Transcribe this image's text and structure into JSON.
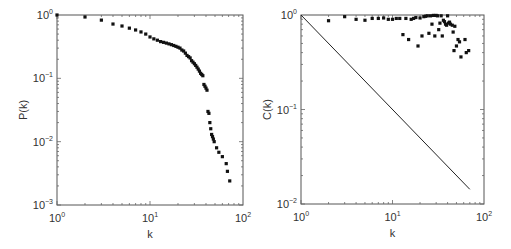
{
  "chart_data": [
    {
      "type": "scatter",
      "title": "",
      "xlabel": "k",
      "ylabel": "P(k)",
      "xscale": "log",
      "yscale": "log",
      "xlim": [
        1,
        100
      ],
      "ylim": [
        0.001,
        1
      ],
      "x_ticks": [
        "10^0",
        "10^1",
        "10^2"
      ],
      "y_ticks": [
        "10^-3",
        "10^-2",
        "10^-1",
        "10^0"
      ],
      "grid": false,
      "legend": null,
      "series": [
        {
          "name": "P(k)",
          "points": [
            [
              1,
              1.0
            ],
            [
              2,
              0.93
            ],
            [
              3,
              0.83
            ],
            [
              4,
              0.72
            ],
            [
              5,
              0.67
            ],
            [
              6,
              0.62
            ],
            [
              7,
              0.58
            ],
            [
              8,
              0.54
            ],
            [
              9,
              0.5
            ],
            [
              10,
              0.45
            ],
            [
              11,
              0.42
            ],
            [
              12,
              0.4
            ],
            [
              13,
              0.38
            ],
            [
              14,
              0.37
            ],
            [
              15,
              0.36
            ],
            [
              16,
              0.35
            ],
            [
              17,
              0.34
            ],
            [
              18,
              0.33
            ],
            [
              19,
              0.32
            ],
            [
              20,
              0.31
            ],
            [
              21,
              0.3
            ],
            [
              22,
              0.28
            ],
            [
              23,
              0.27
            ],
            [
              24,
              0.25
            ],
            [
              25,
              0.23
            ],
            [
              26,
              0.22
            ],
            [
              27,
              0.21
            ],
            [
              28,
              0.19
            ],
            [
              29,
              0.18
            ],
            [
              30,
              0.17
            ],
            [
              31,
              0.16
            ],
            [
              32,
              0.15
            ],
            [
              33,
              0.14
            ],
            [
              34,
              0.13
            ],
            [
              35,
              0.12
            ],
            [
              36,
              0.115
            ],
            [
              37,
              0.11
            ],
            [
              38,
              0.08
            ],
            [
              39,
              0.075
            ],
            [
              40,
              0.07
            ],
            [
              41,
              0.065
            ],
            [
              42,
              0.03
            ],
            [
              43,
              0.028
            ],
            [
              44,
              0.02
            ],
            [
              45,
              0.016
            ],
            [
              46,
              0.013
            ],
            [
              47,
              0.012
            ],
            [
              48,
              0.011
            ],
            [
              49,
              0.01
            ],
            [
              52,
              0.008
            ],
            [
              55,
              0.0068
            ],
            [
              60,
              0.0058
            ],
            [
              66,
              0.0045
            ],
            [
              68,
              0.0034
            ],
            [
              72,
              0.0024
            ]
          ]
        }
      ]
    },
    {
      "type": "scatter",
      "title": "",
      "xlabel": "k",
      "ylabel": "C(k)",
      "xscale": "log",
      "yscale": "log",
      "xlim": [
        1,
        100
      ],
      "ylim": [
        0.01,
        1
      ],
      "x_ticks": [
        "10^0",
        "10^1",
        "10^2"
      ],
      "y_ticks": [
        "10^-2",
        "10^-1",
        "10^0"
      ],
      "grid": false,
      "legend": null,
      "series": [
        {
          "name": "C(k)",
          "points": [
            [
              2,
              0.87
            ],
            [
              3,
              0.96
            ],
            [
              4,
              0.9
            ],
            [
              5,
              0.88
            ],
            [
              6,
              0.92
            ],
            [
              7,
              0.92
            ],
            [
              8,
              0.93
            ],
            [
              9,
              0.9
            ],
            [
              10,
              0.9
            ],
            [
              11,
              0.92
            ],
            [
              12,
              0.92
            ],
            [
              13,
              0.62
            ],
            [
              14,
              0.92
            ],
            [
              15,
              0.55
            ],
            [
              16,
              0.9
            ],
            [
              17,
              0.92
            ],
            [
              18,
              0.94
            ],
            [
              19,
              0.47
            ],
            [
              20,
              0.93
            ],
            [
              21,
              0.6
            ],
            [
              22,
              0.96
            ],
            [
              23,
              0.97
            ],
            [
              24,
              0.98
            ],
            [
              25,
              0.64
            ],
            [
              26,
              0.98
            ],
            [
              27,
              0.8
            ],
            [
              28,
              0.99
            ],
            [
              29,
              0.6
            ],
            [
              30,
              0.99
            ],
            [
              31,
              0.98
            ],
            [
              32,
              0.7
            ],
            [
              33,
              0.82
            ],
            [
              34,
              0.98
            ],
            [
              35,
              0.6
            ],
            [
              36,
              0.88
            ],
            [
              37,
              0.85
            ],
            [
              38,
              0.8
            ],
            [
              39,
              0.78
            ],
            [
              40,
              0.98
            ],
            [
              41,
              0.82
            ],
            [
              42,
              0.84
            ],
            [
              43,
              0.8
            ],
            [
              45,
              0.78
            ],
            [
              46,
              0.66
            ],
            [
              47,
              0.42
            ],
            [
              48,
              0.76
            ],
            [
              50,
              0.47
            ],
            [
              52,
              0.55
            ],
            [
              54,
              0.52
            ],
            [
              56,
              0.36
            ],
            [
              62,
              0.55
            ],
            [
              64,
              0.4
            ],
            [
              68,
              0.42
            ]
          ]
        },
        {
          "name": "reference line k^-1",
          "type": "line",
          "points": [
            [
              1,
              1.0
            ],
            [
              70,
              0.0143
            ]
          ]
        }
      ]
    }
  ],
  "labels": {
    "left_ylabel": "P(k)",
    "right_ylabel": "C(k)",
    "xlabel": "k"
  }
}
